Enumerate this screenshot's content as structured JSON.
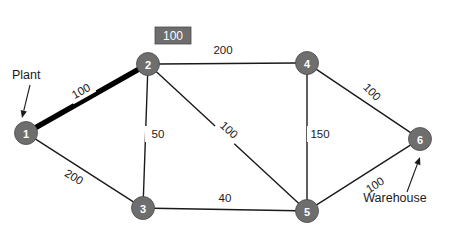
{
  "diagram": {
    "type": "network-graph",
    "width": 467,
    "height": 234,
    "colors": {
      "node_fill": "#6e6e6e",
      "node_stroke": "#4a4a4a",
      "node_text": "#ffffff",
      "edge": "#1a1a1a",
      "highlight_edge": "#000000",
      "background": "#ffffff",
      "badge_fill": "#6e6e6e",
      "label_text": "#1a1a1a"
    }
  },
  "badge": {
    "value": "100",
    "x": 155,
    "y": 27,
    "w": 36,
    "h": 17
  },
  "nodes": [
    {
      "id": "1",
      "label": "1",
      "x": 26,
      "y": 133,
      "r": 11.5
    },
    {
      "id": "2",
      "label": "2",
      "x": 148,
      "y": 64,
      "r": 11.5
    },
    {
      "id": "3",
      "label": "3",
      "x": 143,
      "y": 208,
      "r": 11.5
    },
    {
      "id": "4",
      "label": "4",
      "x": 307,
      "y": 63,
      "r": 11.5
    },
    {
      "id": "5",
      "label": "5",
      "x": 307,
      "y": 211,
      "r": 11.5
    },
    {
      "id": "6",
      "label": "6",
      "x": 420,
      "y": 139,
      "r": 11.5
    }
  ],
  "edges": [
    {
      "id": "e12",
      "from": "1",
      "to": "2",
      "weight": "100",
      "highlight": true,
      "lx": 81,
      "ly": 91,
      "rot": -29.5,
      "x1": 26,
      "y1": 133,
      "x2": 148,
      "y2": 64
    },
    {
      "id": "e13",
      "from": "1",
      "to": "3",
      "weight": "200",
      "highlight": false,
      "lx": 74,
      "ly": 177,
      "rot": 30.5,
      "x1": 26,
      "y1": 133,
      "x2": 143,
      "y2": 208
    },
    {
      "id": "e23",
      "from": "2",
      "to": "3",
      "weight": "50",
      "highlight": false,
      "lx": 158,
      "ly": 134,
      "rot": 0,
      "x1": 148,
      "y1": 64,
      "x2": 143,
      "y2": 208
    },
    {
      "id": "e24",
      "from": "2",
      "to": "4",
      "weight": "200",
      "highlight": false,
      "lx": 223,
      "ly": 50,
      "rot": 0,
      "x1": 148,
      "y1": 64,
      "x2": 307,
      "y2": 63
    },
    {
      "id": "e25",
      "from": "2",
      "to": "5",
      "weight": "100",
      "highlight": false,
      "lx": 229,
      "ly": 130,
      "rot": 42,
      "x1": 148,
      "y1": 64,
      "x2": 307,
      "y2": 211
    },
    {
      "id": "e35",
      "from": "3",
      "to": "5",
      "weight": "40",
      "highlight": false,
      "lx": 225,
      "ly": 198,
      "rot": 0,
      "x1": 143,
      "y1": 208,
      "x2": 307,
      "y2": 211
    },
    {
      "id": "e45",
      "from": "4",
      "to": "5",
      "weight": "150",
      "highlight": false,
      "lx": 320,
      "ly": 134,
      "rot": 0,
      "x1": 307,
      "y1": 63,
      "x2": 307,
      "y2": 211
    },
    {
      "id": "e46",
      "from": "4",
      "to": "6",
      "weight": "100",
      "highlight": false,
      "lx": 372,
      "ly": 92,
      "rot": 45,
      "x1": 307,
      "y1": 63,
      "x2": 420,
      "y2": 139
    },
    {
      "id": "e56",
      "from": "5",
      "to": "6",
      "weight": "100",
      "highlight": false,
      "lx": 375,
      "ly": 185,
      "rot": -33,
      "x1": 307,
      "y1": 211,
      "x2": 420,
      "y2": 139
    }
  ],
  "annotations": [
    {
      "id": "plant",
      "label": "Plant",
      "tx": 12,
      "ty": 75,
      "ax1": 30,
      "ay1": 85,
      "ax2": 22,
      "ay2": 118,
      "anchor": "start"
    },
    {
      "id": "warehouse",
      "label": "Warehouse",
      "tx": 395,
      "ty": 198,
      "ax1": 407,
      "ay1": 192,
      "ax2": 420,
      "ay2": 157,
      "anchor": "middle"
    }
  ]
}
